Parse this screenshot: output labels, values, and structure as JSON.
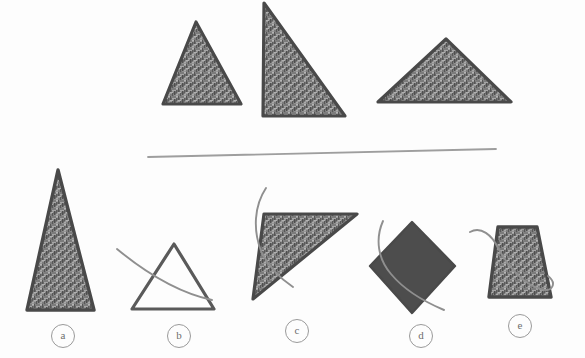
{
  "page": {
    "kind": "visual-reasoning-puzzle",
    "background_color": "#fdfdfd",
    "width": 585,
    "height": 358
  },
  "colors": {
    "texture_base": "#7b7b7b",
    "texture_light": "#b0b0b0",
    "texture_dark": "#535353",
    "shape_outline": "#4a4a4a",
    "solid_fill": "#4d4d4d",
    "divider": "#9e9e9e",
    "pen_stroke": "#8d8d8d",
    "label_ring": "#9a9a9a",
    "label_text": "#6d6d6d"
  },
  "prompt_row": {
    "name": "prompt-shapes",
    "shapes": [
      {
        "id": "prompt-shape-1",
        "kind": "triangle",
        "fill": "texture",
        "description": "isosceles triangle pointing up",
        "points": "196,22 241,104 163,104"
      },
      {
        "id": "prompt-shape-2",
        "kind": "triangle",
        "fill": "texture",
        "description": "right triangle, vertical left edge",
        "points": "264,3 345,116 263,116"
      },
      {
        "id": "prompt-shape-3",
        "kind": "triangle",
        "fill": "texture",
        "description": "wide obtuse triangle pointing up",
        "points": "446,39 511,102 378,102"
      }
    ]
  },
  "divider": {
    "name": "section-divider",
    "x1": 148,
    "y1": 157,
    "x2": 496,
    "y2": 149
  },
  "options": [
    {
      "id": "option-a",
      "label": "a",
      "kind": "triangle",
      "fill": "texture",
      "description": "tall narrow isosceles triangle",
      "points": "58,170 94,310 27,310",
      "label_x": 51,
      "label_y": 324,
      "pen_mark": null
    },
    {
      "id": "option-b",
      "label": "b",
      "kind": "triangle",
      "fill": "none",
      "description": "unfilled outlined isosceles triangle",
      "points": "174,244 214,309 132,309",
      "label_x": 167,
      "label_y": 324,
      "pen_mark": "M 117,249 C 140,268 175,292 212,299"
    },
    {
      "id": "option-c",
      "label": "c",
      "kind": "triangle",
      "fill": "texture",
      "description": "right triangle rotated, hypotenuse lower-left to upper-right",
      "points": "355,215 259,295 259,295 278,242",
      "points_full": "356,215 263,215 263,216 254,298 342,216",
      "label_x": 285,
      "label_y": 319,
      "pen_mark": "M 265,189 C 255,205 254,228 262,249 C 270,266 281,277 292,285"
    },
    {
      "id": "option-d",
      "label": "d",
      "kind": "diamond",
      "fill": "solid",
      "description": "solid dark diamond (rotated square)",
      "points": "412,222 455,266 412,313 370,266",
      "label_x": 409,
      "label_y": 324,
      "pen_mark": "M 383,222 C 376,238 378,258 390,273 C 404,291 424,301 443,309"
    },
    {
      "id": "option-e",
      "label": "e",
      "kind": "trapezoid",
      "fill": "texture",
      "description": "trapezoid narrower at top",
      "points": "498,227 537,227 551,297 489,297",
      "label_x": 508,
      "label_y": 314,
      "pen_mark": "M 471,231 C 482,227 492,235 497,247 C 506,264 520,281 540,288 C 552,292 556,283 548,276"
    }
  ]
}
